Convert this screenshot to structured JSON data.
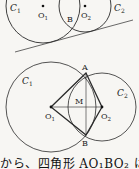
{
  "figure_top": {
    "circle1_label": "C",
    "circle1_sub": "1",
    "circle2_label": "C",
    "circle2_sub": "2",
    "center1_label": "O",
    "center1_sub": "1",
    "center2_label": "O",
    "center2_sub": "2",
    "intersection_label": "B"
  },
  "figure_bottom": {
    "circle1_label": "C",
    "circle1_sub": "1",
    "circle2_label": "C",
    "circle2_sub": "2",
    "center1_label": "O",
    "center1_sub": "1",
    "center2_label": "O",
    "center2_sub": "2",
    "point_a_label": "A",
    "point_b_label": "B",
    "midpoint_label": "M"
  },
  "caption": "から、四角形 AO₁BO₂ は",
  "colors": {
    "line": "#2a2a2a",
    "background": "#f7f6f3"
  }
}
